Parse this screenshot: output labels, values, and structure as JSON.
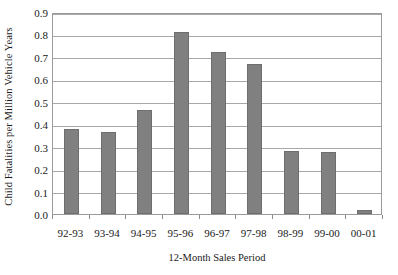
{
  "chart_data": {
    "type": "bar",
    "title": "",
    "xlabel": "12-Month Sales Period",
    "ylabel": "Child Fatalities per Million Vehicle Years",
    "categories": [
      "92-93",
      "93-94",
      "94-95",
      "95-96",
      "96-97",
      "97-98",
      "98-99",
      "99-00",
      "00-01"
    ],
    "values": [
      0.38,
      0.365,
      0.465,
      0.81,
      0.72,
      0.67,
      0.28,
      0.275,
      0.02
    ],
    "ylim": [
      0.0,
      0.9
    ],
    "ytick_labels": [
      "0.0",
      "0.1",
      "0.2",
      "0.3",
      "0.4",
      "0.5",
      "0.6",
      "0.7",
      "0.8",
      "0.9"
    ],
    "ytick_values": [
      0.0,
      0.1,
      0.2,
      0.3,
      0.4,
      0.5,
      0.6,
      0.7,
      0.8,
      0.9
    ],
    "grid": true,
    "legend": null,
    "bar_color": "#808080",
    "bar_edge_color": "#6e6e6e",
    "gridline_color": "#a8a8a8",
    "axis_color": "#9a9a9a",
    "plot_background": "#ffffff"
  }
}
